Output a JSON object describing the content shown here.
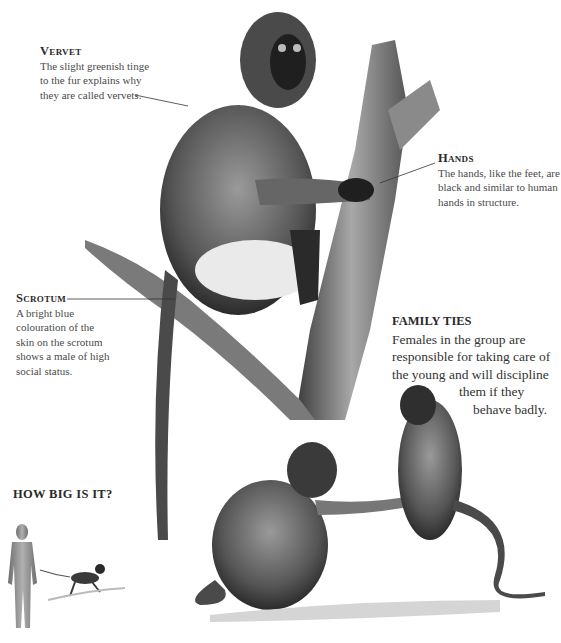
{
  "callouts": {
    "vervet": {
      "heading": "Vervet",
      "lines": [
        "The slight greenish tinge",
        "to the fur explains why",
        "they are called vervets."
      ]
    },
    "hands": {
      "heading": "Hands",
      "lines": [
        "The hands, like the feet, are",
        "black and similar to human",
        "hands in structure."
      ]
    },
    "scrotum": {
      "heading": "Scrotum",
      "lines": [
        "A bright blue",
        "colouration of the",
        "skin on the scrotum",
        "shows a male of high",
        "social status."
      ]
    }
  },
  "family_ties": {
    "heading": "FAMILY TIES",
    "lines": [
      "Females in the group are",
      "responsible for taking care of",
      "the young and will discipline",
      "them if they",
      "behave badly."
    ]
  },
  "how_big": {
    "heading": "HOW BIG IS IT?"
  },
  "colors": {
    "text": "#4a4a4a",
    "heading": "#2a2a2a",
    "silhouette": "#8a8a8a",
    "fur_dark": "#2b2b2b",
    "fur_mid": "#6a6a6a",
    "bark": "#7a7a7a"
  }
}
